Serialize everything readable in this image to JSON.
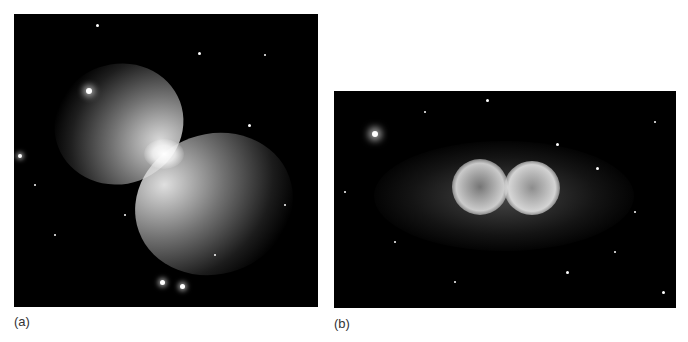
{
  "figure": {
    "panels": [
      {
        "id": "a",
        "label": "(a)",
        "subject": "bipolar hourglass nebula (Boomerang-like) on star field",
        "palette": {
          "background": "#000000",
          "nebula": "#e8e8e8"
        }
      },
      {
        "id": "b",
        "label": "(b)",
        "subject": "bipolar twin-lobed nebula (Ant-like) on dense star field",
        "palette": {
          "background": "#000000",
          "nebula": "#d0d0d0"
        }
      }
    ]
  }
}
